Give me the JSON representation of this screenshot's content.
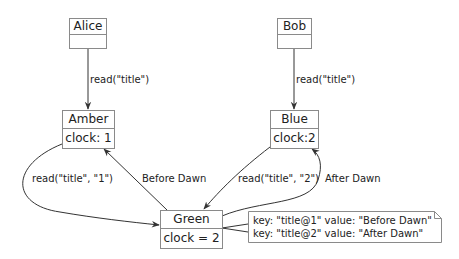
{
  "diagram": {
    "type": "communication-diagram",
    "nodes": [
      {
        "id": "alice",
        "title": "Alice",
        "body": ""
      },
      {
        "id": "bob",
        "title": "Bob",
        "body": ""
      },
      {
        "id": "amber",
        "title": "Amber",
        "body": "clock: 1"
      },
      {
        "id": "blue",
        "title": "Blue",
        "body": "clock:2"
      },
      {
        "id": "green",
        "title": "Green",
        "body": "clock = 2"
      }
    ],
    "edges": [
      {
        "from": "alice",
        "to": "amber",
        "label": "read(\"title\")"
      },
      {
        "from": "bob",
        "to": "blue",
        "label": "read(\"title\")"
      },
      {
        "from": "amber",
        "to": "green",
        "label": "read(\"title\", \"1\")"
      },
      {
        "from": "green",
        "to": "amber",
        "label": "Before Dawn"
      },
      {
        "from": "blue",
        "to": "green",
        "label": "read(\"title\", \"2\")"
      },
      {
        "from": "green",
        "to": "blue",
        "label": "After Dawn"
      }
    ],
    "note": {
      "attached_to": "green",
      "lines": [
        "key: \"title@1\" value: \"Before Dawn\"",
        "key: \"title@2\" value: \"After Dawn\""
      ]
    }
  }
}
